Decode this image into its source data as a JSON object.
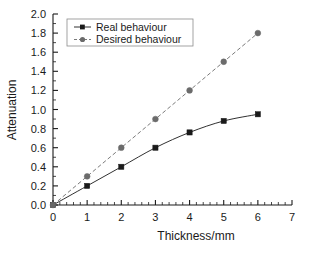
{
  "chart_data": {
    "type": "line",
    "title": "",
    "xlabel": "Thickness/mm",
    "ylabel": "Attenuation",
    "xlim": [
      0,
      7
    ],
    "ylim": [
      0.0,
      2.0
    ],
    "xticks": [
      "0",
      "1",
      "2",
      "3",
      "4",
      "5",
      "6",
      "7"
    ],
    "xtick_values": [
      0,
      1,
      2,
      3,
      4,
      5,
      6,
      7
    ],
    "yticks": [
      "0.0",
      "0.2",
      "0.4",
      "0.6",
      "0.8",
      "1.0",
      "1.2",
      "1.4",
      "1.6",
      "1.8",
      "2.0"
    ],
    "ytick_values": [
      0.0,
      0.2,
      0.4,
      0.6,
      0.8,
      1.0,
      1.2,
      1.4,
      1.6,
      1.8,
      2.0
    ],
    "grid": false,
    "legend_position": "upper left (inside plot area)",
    "x": [
      0,
      1,
      2,
      3,
      4,
      5,
      6
    ],
    "series": [
      {
        "name": "Real behaviour",
        "values": [
          0.0,
          0.2,
          0.4,
          0.6,
          0.76,
          0.88,
          0.95
        ],
        "color": "#1a1a1a",
        "marker": "square",
        "linestyle": "solid"
      },
      {
        "name": "Desired behaviour",
        "values": [
          0.0,
          0.3,
          0.6,
          0.9,
          1.2,
          1.5,
          1.8
        ],
        "color": "#6b6b6b",
        "marker": "circle",
        "linestyle": "dashed"
      }
    ]
  },
  "legend": {
    "entries": [
      {
        "label": "Real behaviour"
      },
      {
        "label": "Desired behaviour"
      }
    ]
  },
  "axes": {
    "x_title": "Thickness/mm",
    "y_title": "Attenuation"
  }
}
